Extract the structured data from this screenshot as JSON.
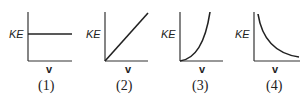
{
  "figure": {
    "panels": [
      {
        "id": "1",
        "ylabel": "KE",
        "xlabel": "v",
        "caption": "(1)",
        "shape": "constant"
      },
      {
        "id": "2",
        "ylabel": "KE",
        "xlabel": "v",
        "caption": "(2)",
        "shape": "linear-increasing"
      },
      {
        "id": "3",
        "ylabel": "KE",
        "xlabel": "v",
        "caption": "(3)",
        "shape": "quadratic-increasing"
      },
      {
        "id": "4",
        "ylabel": "KE",
        "xlabel": "v",
        "caption": "(4)",
        "shape": "inverse-decreasing"
      }
    ]
  }
}
